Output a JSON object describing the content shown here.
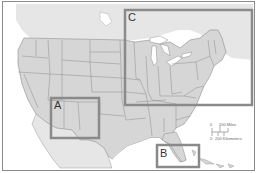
{
  "map": {
    "subject": "Contiguous United States with neighboring Canada, Mexico and Caribbean",
    "land_color": "#d9d9d9",
    "water_color": "#ffffff",
    "border_color": "#8c8c8c",
    "inset_color": "#8a8a8a",
    "insets": [
      {
        "label": "A",
        "region": "Southwest (Arizona / New Mexico)"
      },
      {
        "label": "B",
        "region": "Southeast (Florida / Georgia)"
      },
      {
        "label": "C",
        "region": "Northeast / Great Lakes"
      }
    ],
    "scale": {
      "zero": "0",
      "miles_label": "200 Miles",
      "km_label": "200 Kilometers"
    }
  }
}
